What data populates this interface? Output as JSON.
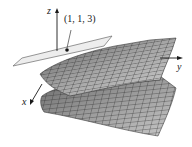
{
  "figure": {
    "axes": {
      "x_label": "x",
      "y_label": "y",
      "z_label": "z"
    },
    "point": {
      "label": "(1, 1, 3)",
      "coords": [
        1,
        1,
        3
      ]
    },
    "colors": {
      "surface_light": "#d4d4d4",
      "surface_dark": "#7a7a7a",
      "grid_line": "#2e2e2e",
      "plane_fill": "#ececec",
      "plane_edge": "#6a6a6a",
      "axis": "#1a1a1a"
    }
  }
}
